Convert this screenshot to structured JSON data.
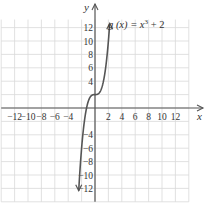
{
  "chart_data": {
    "type": "line",
    "title": "",
    "xlabel": "x",
    "ylabel": "y",
    "xlim": [
      -14,
      14
    ],
    "ylim": [
      -14,
      14
    ],
    "grid": true,
    "x_ticks": [
      -12,
      -10,
      -8,
      -6,
      -4,
      2,
      4,
      6,
      8,
      10,
      12
    ],
    "y_ticks": [
      12,
      10,
      8,
      6,
      4,
      -4,
      -6,
      -8,
      -10,
      -12
    ],
    "x_tick_labels": [
      "−12",
      "−10",
      "−8",
      "−6",
      "−4",
      "2",
      "4",
      "6",
      "8",
      "10",
      "12"
    ],
    "y_tick_labels": [
      "12",
      "10",
      "8",
      "6",
      "4",
      "−4",
      "−6",
      "−8",
      "−10",
      "−12"
    ],
    "series": [
      {
        "name": "g(x) = x^3 + 2",
        "function": "x^3 + 2",
        "x": [
          -2.45,
          -2,
          -1.5,
          -1,
          -0.5,
          0,
          0.5,
          1,
          1.5,
          2,
          2.2
        ],
        "y": [
          -12.7,
          -6,
          -1.375,
          1,
          1.875,
          2,
          2.125,
          3,
          5.375,
          10,
          12.65
        ]
      }
    ],
    "annotations": [
      {
        "text": "g(x) = x³ + 2",
        "position": "upper-right of curve end"
      }
    ]
  },
  "labels": {
    "x_axis": "x",
    "y_axis": "y",
    "function_prefix": "g (x) = x",
    "function_exp": "3",
    "function_suffix": " + 2"
  }
}
